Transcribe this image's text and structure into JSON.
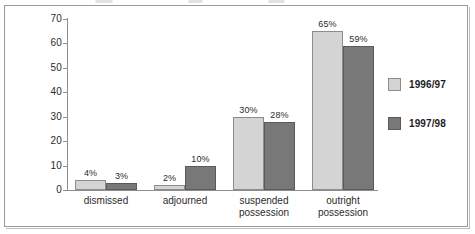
{
  "chart_data": {
    "type": "bar",
    "title": "",
    "xlabel": "",
    "ylabel": "",
    "ylim": [
      0,
      70
    ],
    "yticks": [
      0,
      10,
      20,
      30,
      40,
      50,
      60,
      70
    ],
    "ytick_labels": [
      "0",
      "10",
      "20",
      "30",
      "40",
      "50",
      "60",
      "70"
    ],
    "grid": false,
    "legend_position": "right",
    "categories": [
      "dismissed",
      "adjourned",
      "suspended possession",
      "outright possession"
    ],
    "category_lines": [
      [
        "dismissed"
      ],
      [
        "adjourned"
      ],
      [
        "suspended",
        "possession"
      ],
      [
        "outright",
        "possession"
      ]
    ],
    "series": [
      {
        "name": "1996/97",
        "color": "#d4d4d4",
        "values": [
          4,
          2,
          30,
          65
        ],
        "data_labels": [
          "4%",
          "2%",
          "30%",
          "65%"
        ]
      },
      {
        "name": "1997/98",
        "color": "#787878",
        "values": [
          3,
          10,
          28,
          59
        ],
        "data_labels": [
          "3%",
          "10%",
          "28%",
          "59%"
        ]
      }
    ]
  },
  "legend": {
    "entries": [
      {
        "label": "1996/97",
        "swatch": "light"
      },
      {
        "label": "1997/98",
        "swatch": "dark"
      }
    ]
  },
  "colors": {
    "series_1996_97": "#d4d4d4",
    "series_1997_98": "#787878",
    "axis": "#8e8e8e",
    "frame": "#9a9a9a",
    "text": "#2b2b2b"
  }
}
